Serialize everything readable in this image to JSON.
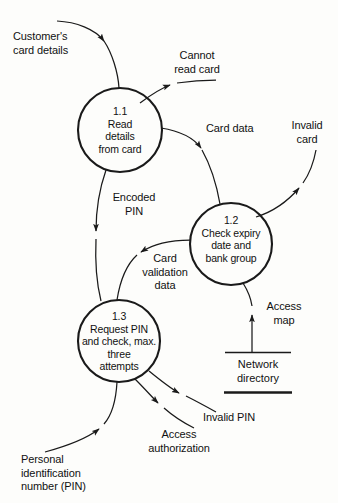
{
  "diagram": {
    "type": "data-flow-diagram",
    "title": "",
    "stroke_color": "#1a1a1a",
    "background_color": "#fdfdfb",
    "processes": [
      {
        "id": "1.1",
        "number": "1.1",
        "name": "Read\ndetails\nfrom card",
        "text": "1.1\nRead\ndetails\nfrom card",
        "cx": 120,
        "cy": 130,
        "r": 42
      },
      {
        "id": "1.2",
        "number": "1.2",
        "name": "Check expiry\ndate and\nbank group",
        "text": "1.2\nCheck expiry\ndate and\nbank group",
        "cx": 231,
        "cy": 244,
        "r": 41
      },
      {
        "id": "1.3",
        "number": "1.3",
        "name": "Request PIN\nand check, max.\nthree\nattempts",
        "text": "1.3\nRequest PIN\nand check, max.\nthree\nattempts",
        "cx": 119,
        "cy": 341,
        "r": 41
      }
    ],
    "datastores": [
      {
        "id": "network-directory",
        "label": "Network\ndirectory",
        "x": 225,
        "y": 352,
        "width": 66,
        "height": 41
      }
    ],
    "flows": [
      {
        "id": "customers-card-details",
        "label": "Customer's\ncard details",
        "from": "external",
        "to": "1.1"
      },
      {
        "id": "cannot-read-card",
        "label": "Cannot\nread card",
        "from": "1.1",
        "to": "external"
      },
      {
        "id": "card-data",
        "label": "Card data",
        "from": "1.1",
        "to": "1.2"
      },
      {
        "id": "invalid-card",
        "label": "Invalid\ncard",
        "from": "1.2",
        "to": "external"
      },
      {
        "id": "encoded-pin",
        "label": "Encoded\nPIN",
        "from": "1.1",
        "to": "1.3"
      },
      {
        "id": "card-validation-data",
        "label": "Card\nvalidation\ndata",
        "from": "1.2",
        "to": "1.3"
      },
      {
        "id": "access-map",
        "label": "Access\nmap",
        "from": "network-directory",
        "to": "1.2"
      },
      {
        "id": "invalid-pin",
        "label": "Invalid PIN",
        "from": "1.3",
        "to": "external"
      },
      {
        "id": "access-authorization",
        "label": "Access\nauthorization",
        "from": "1.3",
        "to": "external"
      },
      {
        "id": "personal-identification-number",
        "label": "Personal\nidentification\nnumber (PIN)",
        "from": "external",
        "to": "1.3"
      }
    ]
  }
}
